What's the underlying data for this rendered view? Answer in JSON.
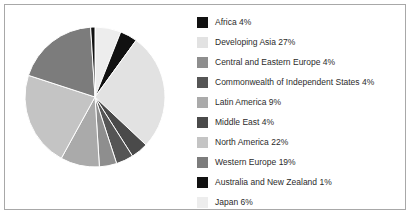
{
  "chart_data": {
    "type": "pie",
    "title": "",
    "categories": [
      "Africa",
      "Developing Asia",
      "Central and Eastern Europe",
      "Commonwealth of Independent States",
      "Latin America",
      "Middle East",
      "North America",
      "Western Europe",
      "Australia and New Zealand",
      "Japan"
    ],
    "values": [
      4,
      27,
      4,
      4,
      9,
      4,
      22,
      19,
      1,
      6
    ],
    "units": "%",
    "legend_position": "right",
    "grid": false,
    "start_angle_deg": 0,
    "direction": "clockwise",
    "slice_order_clockwise_from_top": [
      "Japan",
      "Africa",
      "Developing Asia",
      "Middle East",
      "Commonwealth of Independent States",
      "Central and Eastern Europe",
      "Latin America",
      "North America",
      "Western Europe",
      "Australia and New Zealand"
    ],
    "colors": {
      "Africa": "#111111",
      "Developing Asia": "#e2e2e2",
      "Central and Eastern Europe": "#8e8e8e",
      "Commonwealth of Independent States": "#555555",
      "Latin America": "#aaaaaa",
      "Middle East": "#4a4a4a",
      "North America": "#c4c4c4",
      "Western Europe": "#7c7c7c",
      "Australia and New Zealand": "#111111",
      "Japan": "#ededed"
    },
    "slice_edge_color": "#ffffff"
  },
  "legend": {
    "items": [
      {
        "label": "Africa 4%",
        "swatch": "#111111"
      },
      {
        "label": "Developing Asia 27%",
        "swatch": "#e2e2e2"
      },
      {
        "label": "Central and Eastern Europe 4%",
        "swatch": "#8e8e8e"
      },
      {
        "label": "Commonwealth of Independent States 4%",
        "swatch": "#555555"
      },
      {
        "label": "Latin America 9%",
        "swatch": "#aaaaaa"
      },
      {
        "label": "Middle East 4%",
        "swatch": "#4a4a4a"
      },
      {
        "label": "North America 22%",
        "swatch": "#c4c4c4"
      },
      {
        "label": "Western Europe 19%",
        "swatch": "#7c7c7c"
      },
      {
        "label": "Australia and New Zealand 1%",
        "swatch": "#111111"
      },
      {
        "label": "Japan 6%",
        "swatch": "#ededed"
      }
    ]
  },
  "frame": {
    "border_color": "#a8a8a8",
    "background": "#ffffff"
  }
}
